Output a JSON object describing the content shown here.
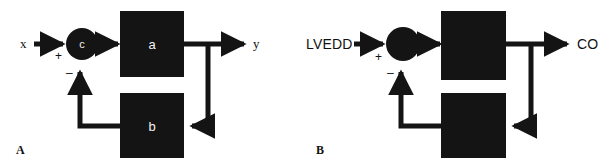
{
  "figure": {
    "width": 603,
    "height": 168,
    "background": "#ffffff",
    "ink": "#141414",
    "label_color": "#111111",
    "block_text_color": "#f2f2f2"
  },
  "panels": [
    {
      "id": "a",
      "letter": "A",
      "input_label": "x",
      "output_label": "y",
      "input_label_font": "serif",
      "summer": {
        "label": "c",
        "plus": "+",
        "minus": "–"
      },
      "forward_block": {
        "label": "a"
      },
      "feedback_block": {
        "label": "b"
      }
    },
    {
      "id": "b",
      "letter": "B",
      "input_label": "LVEDD",
      "output_label": "CO",
      "input_label_font": "sans",
      "summer": {
        "label": "",
        "plus": "+",
        "minus": "–"
      },
      "forward_block": {
        "label": ""
      },
      "feedback_block": {
        "label": ""
      }
    }
  ],
  "diagram": {
    "type": "block-diagram",
    "topology": {
      "nodes": [
        "input",
        "summing-junction",
        "forward-block",
        "output",
        "feedback-block"
      ],
      "edges": [
        "input -> summing-junction (+)",
        "summing-junction -> forward-block",
        "forward-block -> output",
        "output -> feedback-block",
        "feedback-block -> summing-junction (-)"
      ]
    }
  }
}
